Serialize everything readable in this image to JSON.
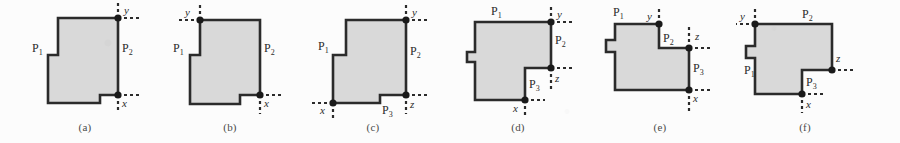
{
  "figure": {
    "background_color": "#fcfcfc",
    "fill_color": "#d9d9d9",
    "stroke_color": "#2b2b2b",
    "marker_color": "#1a1a1a",
    "panel_count": 6
  },
  "panels": [
    {
      "caption": "(a)",
      "points": [
        {
          "name": "y",
          "label": "y"
        },
        {
          "name": "x",
          "label": "x"
        }
      ],
      "edges": [
        {
          "name": "P1",
          "base": "P",
          "sub": "1"
        },
        {
          "name": "P2",
          "base": "P",
          "sub": "2"
        }
      ]
    },
    {
      "caption": "(b)",
      "points": [
        {
          "name": "y",
          "label": "y"
        },
        {
          "name": "x",
          "label": "x"
        }
      ],
      "edges": [
        {
          "name": "P1",
          "base": "P",
          "sub": "1"
        },
        {
          "name": "P2",
          "base": "P",
          "sub": "2"
        }
      ]
    },
    {
      "caption": "(c)",
      "points": [
        {
          "name": "y",
          "label": "y"
        },
        {
          "name": "x",
          "label": "x"
        },
        {
          "name": "z",
          "label": "z"
        }
      ],
      "edges": [
        {
          "name": "P1",
          "base": "P",
          "sub": "1"
        },
        {
          "name": "P2",
          "base": "P",
          "sub": "2"
        },
        {
          "name": "P3",
          "base": "P",
          "sub": "3"
        }
      ]
    },
    {
      "caption": "(d)",
      "points": [
        {
          "name": "y",
          "label": "y"
        },
        {
          "name": "z",
          "label": "z"
        },
        {
          "name": "x",
          "label": "x"
        }
      ],
      "edges": [
        {
          "name": "P1",
          "base": "P",
          "sub": "1"
        },
        {
          "name": "P2",
          "base": "P",
          "sub": "2"
        },
        {
          "name": "P3",
          "base": "P",
          "sub": "3"
        }
      ]
    },
    {
      "caption": "(e)",
      "points": [
        {
          "name": "y",
          "label": "y"
        },
        {
          "name": "z",
          "label": "z"
        },
        {
          "name": "x",
          "label": "x"
        }
      ],
      "edges": [
        {
          "name": "P1",
          "base": "P",
          "sub": "1"
        },
        {
          "name": "P2",
          "base": "P",
          "sub": "2"
        },
        {
          "name": "P3",
          "base": "P",
          "sub": "3"
        }
      ]
    },
    {
      "caption": "(f)",
      "points": [
        {
          "name": "y",
          "label": "y"
        },
        {
          "name": "z",
          "label": "z"
        },
        {
          "name": "x",
          "label": "x"
        }
      ],
      "edges": [
        {
          "name": "P1",
          "base": "P",
          "sub": "1"
        },
        {
          "name": "P2",
          "base": "P",
          "sub": "2"
        },
        {
          "name": "P3",
          "base": "P",
          "sub": "3"
        }
      ]
    }
  ]
}
